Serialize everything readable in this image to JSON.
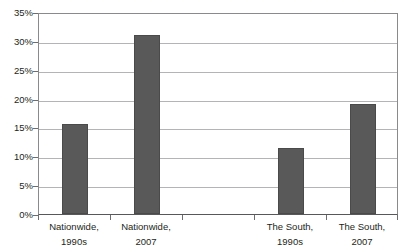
{
  "chart_data": {
    "type": "bar",
    "title": "",
    "xlabel": "",
    "ylabel": "",
    "categories": [
      "Nationwide, 1990s",
      "Nationwide, 2007",
      "",
      "The South, 1990s",
      "The South, 2007"
    ],
    "category_lines": [
      [
        "Nationwide,",
        "1990s"
      ],
      [
        "Nationwide,",
        "2007"
      ],
      [
        "",
        ""
      ],
      [
        "The South,",
        "1990s"
      ],
      [
        "The South,",
        "2007"
      ]
    ],
    "values": [
      15.6,
      31.0,
      null,
      11.4,
      19.0
    ],
    "ylim": [
      0,
      35
    ],
    "ytick_values": [
      0,
      5,
      10,
      15,
      20,
      25,
      30,
      35
    ],
    "ytick_labels": [
      "0%",
      "5%",
      "10%",
      "15%",
      "20%",
      "25%",
      "30%",
      "35%"
    ],
    "grid": true,
    "legend": false,
    "legend_position": "none",
    "bar_color": "#595959",
    "gridline_color": "#b4b4b6",
    "axis_color": "#58585a",
    "text_color": "#231f20"
  }
}
